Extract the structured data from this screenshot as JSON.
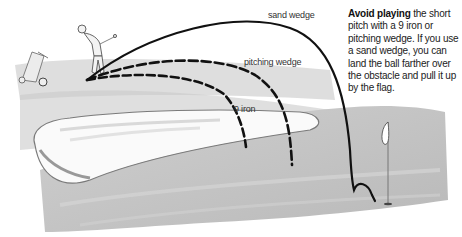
{
  "diagram": {
    "trajectories": [
      {
        "label": "sand wedge",
        "style": "solid"
      },
      {
        "label": "pitching wedge",
        "style": "dashed"
      },
      {
        "label": "9 iron",
        "style": "dashed"
      }
    ],
    "elements": [
      "golfer",
      "golf-bag-trolley",
      "bunker",
      "green",
      "flag"
    ]
  },
  "labels": {
    "sand_wedge": "sand wedge",
    "pitching_wedge": "pitching wedge",
    "nine_iron": "9 iron"
  },
  "caption": {
    "bold": "Avoid playing",
    "text": " the short pitch with a 9 iron or pitching wedge. If you use a sand wedge, you can land the ball farther over the obstacle and pull it up by the flag."
  },
  "colors": {
    "ink": "#111111",
    "sand_shadow": "#b8b8b8",
    "green": "#c4c4c4"
  }
}
